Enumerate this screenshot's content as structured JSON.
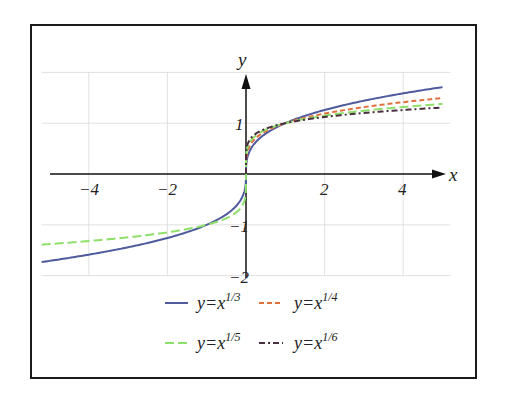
{
  "chart_data": {
    "type": "line",
    "title": "",
    "xlabel": "x",
    "ylabel": "y",
    "xlim": [
      -5.2,
      5.2
    ],
    "ylim": [
      -2,
      2
    ],
    "grid": true,
    "x_ticks": [
      "-4",
      "-2",
      "2",
      "4"
    ],
    "y_ticks": [
      "1",
      "-1",
      "-2"
    ],
    "legend_position": "bottom",
    "series": [
      {
        "name": "y=x^(1/3)",
        "label_base": "y=x",
        "label_exp": "1/3",
        "exponent_denominator": 3,
        "domain": "all reals",
        "color": "#4f5b9c",
        "dash": "solid"
      },
      {
        "name": "y=x^(1/4)",
        "label_base": "y=x",
        "label_exp": "1/4",
        "exponent_denominator": 4,
        "domain": "x>=0",
        "color": "#e0703c",
        "dash": "dashed"
      },
      {
        "name": "y=x^(1/5)",
        "label_base": "y=x",
        "label_exp": "1/5",
        "exponent_denominator": 5,
        "domain": "all reals",
        "color": "#8ee06a",
        "dash": "long-dashed"
      },
      {
        "name": "y=x^(1/6)",
        "label_base": "y=x",
        "label_exp": "1/6",
        "exponent_denominator": 6,
        "domain": "x>=0",
        "color": "#4a2f40",
        "dash": "dash-dot"
      }
    ]
  }
}
